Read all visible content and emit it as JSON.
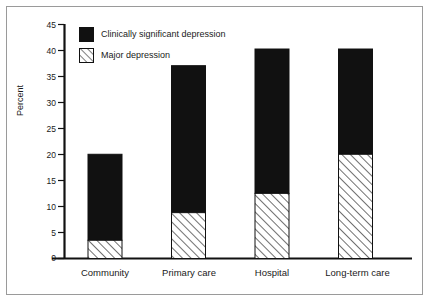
{
  "chart_data": {
    "type": "bar",
    "title": "",
    "xlabel": "",
    "ylabel": "Percent",
    "ylim": [
      0,
      45
    ],
    "yticks": [
      0,
      5,
      10,
      15,
      20,
      25,
      30,
      35,
      40,
      45
    ],
    "grid": false,
    "stacked": true,
    "legend_position": "top-left-inside",
    "categories": [
      "Community",
      "Primary care",
      "Hospital",
      "Long-term care"
    ],
    "series": [
      {
        "name": "Major depression",
        "style": "diagonal-hatch",
        "values": [
          3.5,
          8.8,
          12.5,
          20.0
        ]
      },
      {
        "name": "Clinically significant depression",
        "style": "solid-black",
        "color": "#111111",
        "values": [
          20.0,
          37.0,
          40.2,
          40.2
        ],
        "note": "values are bar totals; black segment spans from the hatched top to the total"
      }
    ]
  },
  "axis": {
    "y_title": "Percent",
    "y_tick_labels": [
      "45",
      "40",
      "35",
      "30",
      "25",
      "20",
      "15",
      "10",
      "5",
      "0"
    ]
  },
  "legend": {
    "items": [
      {
        "label": "Clinically significant depression",
        "swatch": "solid-black"
      },
      {
        "label": "Major depression",
        "swatch": "diagonal-hatch"
      }
    ]
  },
  "categories": [
    {
      "label": "Community"
    },
    {
      "label": "Primary care"
    },
    {
      "label": "Hospital"
    },
    {
      "label": "Long-term care"
    }
  ],
  "colors": {
    "bar_fill": "#111111",
    "hatch_line": "#111111",
    "axis": "#111111",
    "frame": "#9a9a9a",
    "background": "#ffffff"
  }
}
